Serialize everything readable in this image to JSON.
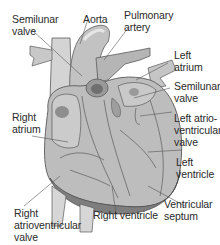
{
  "diagram": {
    "colors": {
      "tissue": "#b9b9b9",
      "tissue_light": "#cfcfcf",
      "tissue_dark": "#8a8a8a",
      "outline": "#5a5a5a",
      "leader_line": "#555555",
      "text": "#2a2a2a",
      "background": "#ffffff"
    },
    "labels": {
      "semilunar_valve_left": [
        "Semilunar",
        "valve"
      ],
      "aorta": [
        "Aorta"
      ],
      "pulmonary_artery": [
        "Pulmonary",
        "artery"
      ],
      "left_atrium": [
        "Left",
        "atrium"
      ],
      "semilunar_valve_right": [
        "Semilunar",
        "valve"
      ],
      "right_atrium": [
        "Right",
        "atrium"
      ],
      "left_atrioventricular_valve": [
        "Left atrio-",
        "ventricular",
        "valve"
      ],
      "left_ventricle": [
        "Left",
        "ventricle"
      ],
      "ventricular_septum": [
        "Ventricular",
        "septum"
      ],
      "right_ventricle": [
        "Right ventricle"
      ],
      "right_atrioventricular_valve": [
        "Right",
        "atrioventricular",
        "valve"
      ]
    }
  }
}
